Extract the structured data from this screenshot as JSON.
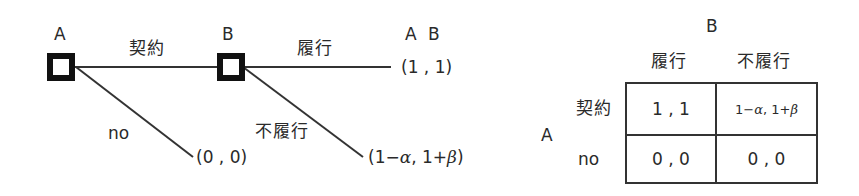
{
  "game_tree": {
    "players": [
      "A",
      "B"
    ],
    "node_a": {
      "label": "A"
    },
    "node_b": {
      "label": "B"
    },
    "edges": {
      "a_contract": "契約",
      "a_no": "no",
      "b_perform": "履行",
      "b_not_perform": "不履行"
    },
    "payoff_header": "A B",
    "payoffs": {
      "perform": "(1 , 1)",
      "no": "(0 , 0)",
      "not_perform_prefix": "(1−",
      "alpha": "α",
      "not_perform_mid": ", 1+",
      "beta": "β",
      "not_perform_suffix": ")"
    }
  },
  "payoff_matrix": {
    "column_player": "B",
    "row_player": "A",
    "columns": [
      "履行",
      "不履行"
    ],
    "rows": [
      {
        "label": "契約",
        "cells": [
          "1 , 1",
          "1− α , 1+ β"
        ]
      },
      {
        "label": "no",
        "cells": [
          "0 , 0",
          "0 , 0"
        ]
      }
    ],
    "cell_0_1_parts": {
      "a": "1− ",
      "alpha": "α",
      "mid": ", 1+ ",
      "beta": "β"
    }
  },
  "colors": {
    "ink": "#2a2a2a",
    "line": "#333333",
    "background": "#ffffff"
  }
}
